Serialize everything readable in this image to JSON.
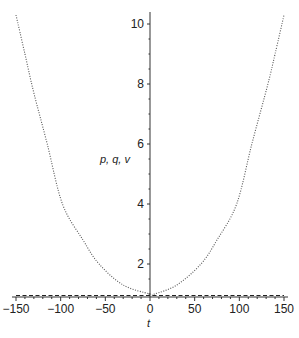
{
  "chart_data": {
    "type": "line",
    "title": "",
    "xlabel": "t",
    "ylabel": "p, q, v",
    "xlim": [
      -150,
      150
    ],
    "ylim": [
      0.9,
      10.4
    ],
    "grid": false,
    "legend": null,
    "x_ticks": [
      -150,
      -100,
      -50,
      0,
      50,
      100,
      150
    ],
    "x_tick_labels": [
      "−150",
      "−100",
      "−50",
      "0",
      "50",
      "100",
      "150"
    ],
    "y_ticks": [
      2,
      4,
      6,
      8,
      10
    ],
    "y_tick_labels": [
      "2",
      "4",
      "6",
      "8",
      "10"
    ],
    "series": [
      {
        "name": "dotted curve",
        "style": "dotted",
        "color": "#555555",
        "x": [
          -150,
          -140,
          -130,
          -115,
          -98,
          -75,
          -57,
          -30,
          0,
          5,
          30,
          57,
          75,
          97,
          114,
          132,
          140,
          150
        ],
        "values": [
          10.3,
          9.0,
          7.7,
          6.0,
          4.0,
          2.8,
          2.0,
          1.3,
          1.0,
          1.0,
          1.3,
          2.0,
          2.8,
          4.0,
          6.0,
          8.0,
          9.0,
          10.3
        ]
      },
      {
        "name": "dashed line",
        "style": "dashed",
        "color": "#222222",
        "x": [
          -150,
          150
        ],
        "values": [
          0.95,
          0.95
        ]
      }
    ]
  },
  "axes": {
    "x_label": "t",
    "y_label": "p, q, v"
  }
}
